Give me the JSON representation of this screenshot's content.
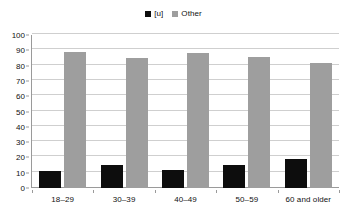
{
  "chart_data": {
    "type": "bar",
    "title": "",
    "subtitle": "",
    "xlabel": "",
    "ylabel": "",
    "categories": [
      "18–29",
      "30–39",
      "40–49",
      "50–59",
      "60 and older"
    ],
    "series": [
      {
        "name": "[u]",
        "color": "#0d0d0d",
        "values": [
          11,
          15,
          12,
          15,
          19
        ]
      },
      {
        "name": "Other",
        "color": "#9e9e9e",
        "values": [
          89,
          85,
          88,
          85.5,
          82
        ]
      }
    ],
    "ylim": [
      0,
      100
    ],
    "ytick_step": 10,
    "yticks": [
      0,
      10,
      20,
      30,
      40,
      50,
      60,
      70,
      80,
      90,
      100
    ],
    "ytick_labels": [
      "0",
      "10",
      "20",
      "30",
      "40",
      "50",
      "60",
      "70",
      "80",
      "90",
      "100"
    ],
    "grid": true,
    "grid_axis": "y",
    "legend_position": "top-center",
    "legend": [
      "[u]",
      "Other"
    ]
  },
  "legend": {
    "items": [
      {
        "label": "[u]",
        "color": "#0d0d0d",
        "swatch_icon": "square-swatch-icon"
      },
      {
        "label": "Other",
        "color": "#9e9e9e",
        "swatch_icon": "square-swatch-icon"
      }
    ]
  },
  "colors": {
    "series_u": "#0d0d0d",
    "series_other": "#9e9e9e",
    "gridline": "#cfcfcf",
    "axis": "#9a9a9a",
    "background": "#ffffff",
    "text": "#111111"
  }
}
